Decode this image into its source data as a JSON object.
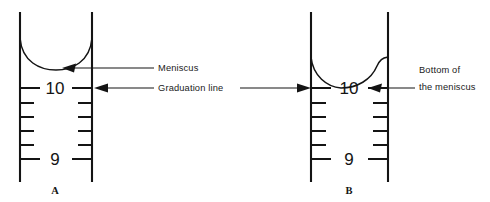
{
  "figure": {
    "background_color": "#ffffff",
    "ink_color": "#141414",
    "width": 490,
    "height": 202
  },
  "panels": [
    {
      "id": "A",
      "letter": "A",
      "description": "Graduated cylinder with meniscus above the graduation line",
      "graduations": [
        {
          "label": "10",
          "value": 10
        },
        {
          "label": "9",
          "value": 9
        }
      ],
      "minor_tick_count": 4
    },
    {
      "id": "B",
      "letter": "B",
      "description": "Graduated cylinder with bottom of meniscus at the graduation line",
      "graduations": [
        {
          "label": "10",
          "value": 10
        },
        {
          "label": "9",
          "value": 9
        }
      ],
      "minor_tick_count": 4
    }
  ],
  "callouts": [
    {
      "id": "meniscus",
      "lines": [
        "Meniscus"
      ]
    },
    {
      "id": "graduation-line",
      "lines": [
        "Graduation line"
      ]
    },
    {
      "id": "bottom-of-the-meniscus",
      "lines": [
        "Bottom of",
        "the meniscus"
      ]
    }
  ],
  "labels": {
    "meniscus": "Meniscus",
    "graduation_line": "Graduation line",
    "bottom_of": "Bottom of",
    "the_meniscus": "the meniscus",
    "panel_a": "A",
    "panel_b": "B",
    "a_ten": "10",
    "a_nine": "9",
    "b_ten": "10",
    "b_nine": "9"
  }
}
